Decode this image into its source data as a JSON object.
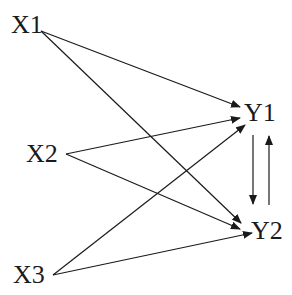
{
  "nodes": {
    "x1": "X1",
    "x2": "X2",
    "x3": "X3",
    "y1": "Y1",
    "y2": "Y2"
  },
  "edges": [
    {
      "from": "X1",
      "to": "Y1"
    },
    {
      "from": "X1",
      "to": "Y2"
    },
    {
      "from": "X2",
      "to": "Y1"
    },
    {
      "from": "X2",
      "to": "Y2"
    },
    {
      "from": "X3",
      "to": "Y1"
    },
    {
      "from": "X3",
      "to": "Y2"
    },
    {
      "from": "Y1",
      "to": "Y2"
    },
    {
      "from": "Y2",
      "to": "Y1"
    }
  ],
  "colors": {
    "line": "#1a1a1a",
    "background": "#ffffff"
  }
}
